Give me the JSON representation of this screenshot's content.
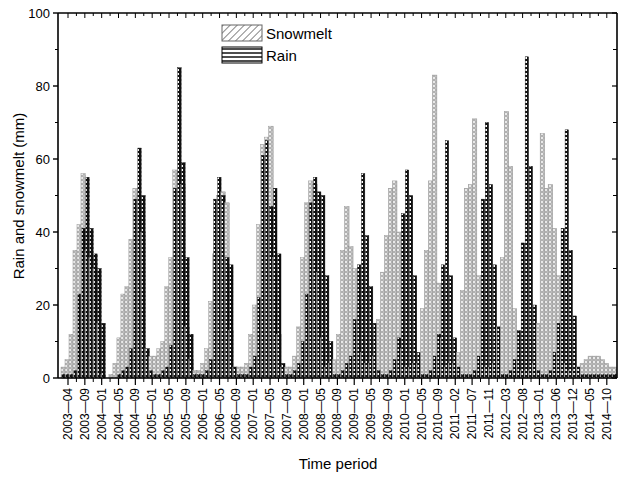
{
  "chart_data": {
    "type": "bar",
    "title": "",
    "xlabel": "Time period",
    "ylabel": "Rain and snowmelt (mm)",
    "ylim": [
      0,
      100
    ],
    "yticks": [
      0,
      20,
      40,
      60,
      80,
      100
    ],
    "grid": false,
    "legend_position": "top-center",
    "legend": [
      "Snowmelt",
      "Rain"
    ],
    "start_month": "2003-04",
    "end_month": "2014-10",
    "xtick_labels": [
      "2003-04",
      "2003-09",
      "2004-01",
      "2004-05",
      "2004-09",
      "2005-01",
      "2005-05",
      "2005-09",
      "2006-01",
      "2006-05",
      "2006-09",
      "2007-01",
      "2007-05",
      "2007-09",
      "2008-01",
      "2008-05",
      "2008-09",
      "2009-01",
      "2009-05",
      "2009-09",
      "2010-01",
      "2010-05",
      "2010-09",
      "2011-02",
      "2011-07",
      "2011-11",
      "2012-03",
      "2012-08",
      "2013-01",
      "2013-06",
      "2013-12",
      "2014-05",
      "2014-10"
    ],
    "series": [
      {
        "name": "Snowmelt",
        "values": [
          3,
          5,
          12,
          35,
          42,
          56,
          35,
          33,
          30,
          15,
          1,
          0,
          1,
          4,
          11,
          23,
          25,
          38,
          52,
          50,
          40,
          8,
          6,
          6,
          8,
          10,
          25,
          33,
          57,
          56,
          53,
          14,
          5,
          2,
          2,
          4,
          8,
          21,
          34,
          50,
          51,
          48,
          13,
          3,
          3,
          3,
          4,
          12,
          20,
          42,
          64,
          66,
          69,
          33,
          12,
          3,
          3,
          3,
          6,
          14,
          33,
          48,
          54,
          53,
          29,
          11,
          3,
          4,
          5,
          12,
          35,
          47,
          36,
          30,
          20,
          7,
          4,
          4,
          6,
          16,
          29,
          39,
          52,
          54,
          40,
          8,
          3,
          3,
          4,
          4,
          19,
          35,
          54,
          83,
          26,
          11,
          3,
          4,
          4,
          7,
          24,
          52,
          53,
          71,
          28,
          14,
          3,
          3,
          4,
          14,
          33,
          73,
          58,
          19,
          5,
          2,
          2,
          2,
          4,
          15,
          67,
          52,
          53,
          41,
          28,
          17,
          4,
          2,
          2,
          3,
          4,
          5,
          6,
          6,
          6,
          5,
          4,
          3,
          3
        ]
      },
      {
        "name": "Rain",
        "values": [
          1,
          1,
          1,
          2,
          23,
          41,
          55,
          41,
          34,
          30,
          15,
          0,
          0,
          0,
          1,
          2,
          3,
          8,
          49,
          63,
          50,
          8,
          2,
          1,
          1,
          2,
          3,
          9,
          52,
          85,
          59,
          33,
          12,
          1,
          1,
          1,
          2,
          5,
          49,
          55,
          50,
          33,
          31,
          3,
          1,
          1,
          1,
          3,
          6,
          22,
          61,
          65,
          47,
          52,
          34,
          4,
          1,
          1,
          2,
          4,
          10,
          23,
          48,
          55,
          51,
          50,
          28,
          10,
          1,
          1,
          2,
          4,
          6,
          16,
          31,
          56,
          39,
          25,
          15,
          2,
          1,
          1,
          2,
          5,
          11,
          45,
          57,
          50,
          28,
          7,
          1,
          1,
          2,
          6,
          12,
          31,
          65,
          28,
          11,
          3,
          1,
          1,
          1,
          2,
          6,
          49,
          70,
          53,
          31,
          14,
          1,
          1,
          2,
          5,
          13,
          37,
          88,
          58,
          20,
          2,
          1,
          1,
          2,
          7,
          15,
          41,
          68,
          35,
          17,
          3,
          1,
          1,
          1,
          1,
          1,
          1,
          1,
          1,
          1
        ]
      }
    ]
  },
  "axes": {
    "x_label": "Time period",
    "y_label": "Rain and snowmelt (mm)",
    "y_tick_labels": [
      "0",
      "20",
      "40",
      "60",
      "80",
      "100"
    ]
  },
  "legend": {
    "items": [
      {
        "label": "Snowmelt",
        "pattern": "diagonal-hatch",
        "color": "#8a8a8a"
      },
      {
        "label": "Rain",
        "pattern": "horizontal-lines",
        "color": "#000000"
      }
    ]
  }
}
